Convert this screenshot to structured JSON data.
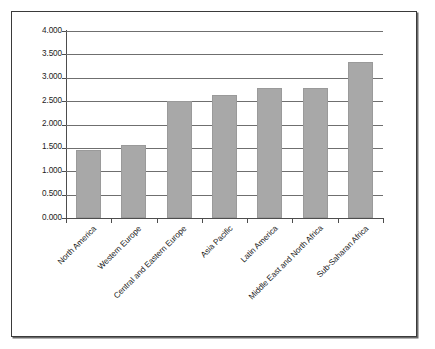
{
  "chart_data": {
    "type": "bar",
    "title": "",
    "xlabel": "",
    "ylabel": "Positive Peace Score",
    "categories": [
      "North America",
      "Western Europe",
      "Central and Eastern Europe",
      "Asia Pacific",
      "Latin America",
      "Middle East and North Africa",
      "Sub-Saharan Africa"
    ],
    "values": [
      1.45,
      1.56,
      2.5,
      2.64,
      2.78,
      2.79,
      3.34
    ],
    "ylim": [
      0.0,
      4.0
    ],
    "ytick_labels": [
      "0.000",
      "0.500",
      "1.000",
      "1.500",
      "2.000",
      "2.500",
      "3.000",
      "3.500",
      "4.000"
    ],
    "ytick_values": [
      0.0,
      0.5,
      1.0,
      1.5,
      2.0,
      2.5,
      3.0,
      3.5,
      4.0
    ],
    "grid": true,
    "legend": false,
    "bar_color": "#a8a8a8",
    "axis_color": "#4d4d4d",
    "gridline_color": "#6f6f6f",
    "frame_color": "#3a3a3a",
    "background": "#ffffff"
  }
}
